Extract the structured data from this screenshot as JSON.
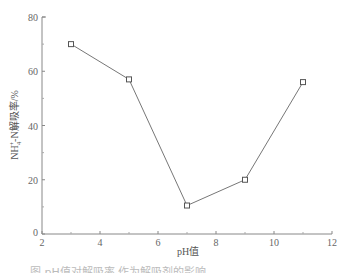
{
  "chart_data": {
    "type": "line",
    "title": "",
    "xlabel": "pH值",
    "ylabel": "NH4+-N解吸率/%",
    "x": [
      3,
      5,
      7,
      9,
      11
    ],
    "series": [
      {
        "name": "NH4+-N解吸率",
        "values": [
          70,
          57,
          10.5,
          20,
          56
        ],
        "marker": "square",
        "color": "#777777"
      }
    ],
    "xlim": [
      2,
      12
    ],
    "ylim": [
      0,
      80
    ],
    "x_ticks": [
      2,
      4,
      6,
      8,
      10,
      12
    ],
    "y_ticks": [
      0,
      20,
      40,
      60,
      80
    ],
    "grid": false,
    "legend": "none"
  },
  "axes": {
    "x_tick_labels": [
      "2",
      "4",
      "6",
      "8",
      "10",
      "12"
    ],
    "y_tick_labels": [
      "0",
      "20",
      "40",
      "60",
      "80"
    ],
    "xlabel": "pH值",
    "ylabel_main": "NH",
    "ylabel_sub": "4",
    "ylabel_sup": "+",
    "ylabel_rest": "-N解吸率/%"
  },
  "caption": "图   pH值对解吸率   作为解吸剂的影响"
}
